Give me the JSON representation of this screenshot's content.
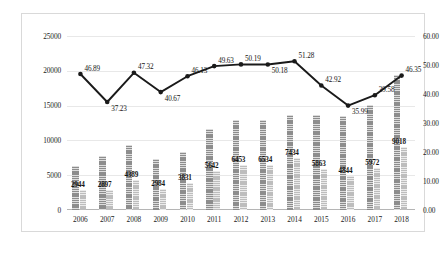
{
  "chart_data": {
    "type": "bar",
    "title": "",
    "subtitle": "",
    "xlabel": "",
    "ylabel": "",
    "categories": [
      "2006",
      "2007",
      "2008",
      "2009",
      "2010",
      "2011",
      "2012",
      "2013",
      "2014",
      "2015",
      "2016",
      "2017",
      "2018"
    ],
    "grid": true,
    "legend": "none",
    "left_axis": {
      "ylim": [
        0,
        25000
      ],
      "ticks": [
        "0",
        "5000",
        "10000",
        "15000",
        "20000",
        "25000"
      ],
      "tick_values": [
        0,
        5000,
        10000,
        15000,
        20000,
        25000
      ]
    },
    "right_axis": {
      "ylim": [
        0,
        60
      ],
      "ticks": [
        "0.00",
        "10.00",
        "20.00",
        "30.00",
        "40.00",
        "50.00",
        "60.00"
      ],
      "tick_values": [
        0,
        10,
        20,
        30,
        40,
        50,
        60
      ]
    },
    "series": [
      {
        "name": "bar-series-a",
        "chart_type": "bar",
        "axis": "left",
        "color": "#8d8d8d",
        "labels_shown": false,
        "values": [
          6280,
          7783,
          9357,
          7339,
          8309,
          11599,
          12957,
          12974,
          13638,
          13662,
          13464,
          15080,
          19456
        ]
      },
      {
        "name": "bar-series-b",
        "chart_type": "bar",
        "axis": "left",
        "color": "#bdbdbd",
        "labels_shown": true,
        "values": [
          2944,
          2897,
          4389,
          2984,
          3831,
          5642,
          6453,
          6534,
          7434,
          5863,
          4844,
          5972,
          9018
        ],
        "value_labels": [
          "2944",
          "2897",
          "4389",
          "2984",
          "3831",
          "5642",
          "6453",
          "6534",
          "7434",
          "5863",
          "4844",
          "5972",
          "9018"
        ]
      },
      {
        "name": "line-series",
        "chart_type": "line",
        "axis": "right",
        "color": "#1a1a1a",
        "marker": "circle",
        "labels_shown": true,
        "values": [
          46.89,
          37.23,
          47.32,
          40.67,
          46.13,
          49.63,
          50.19,
          50.18,
          51.28,
          42.92,
          35.99,
          39.58,
          46.35
        ],
        "value_labels": [
          "46.89",
          "37.23",
          "47.32",
          "40.67",
          "46.13",
          "49.63",
          "50.19",
          "50.18",
          "51.28",
          "42.92",
          "35.99",
          "39.58",
          "46.35"
        ]
      }
    ]
  }
}
